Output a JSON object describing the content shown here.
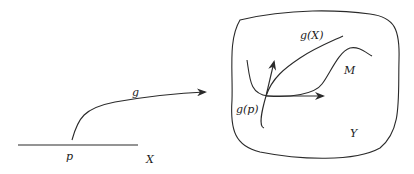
{
  "diagram": {
    "labels": {
      "map": "g",
      "point": "p",
      "domain": "X",
      "image": "g(X)",
      "image_point": "g(p)",
      "submanifold": "M",
      "codomain": "Y"
    },
    "colors": {
      "ink": "#2a2a2a",
      "background": "#ffffff"
    }
  }
}
